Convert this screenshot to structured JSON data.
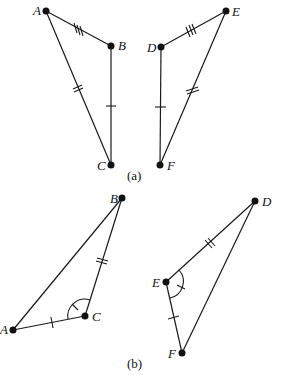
{
  "figure_a": {
    "caption": "(a)",
    "triangle_1": {
      "points": {
        "A": [
          46,
          11
        ],
        "B": [
          111,
          46
        ],
        "C": [
          111,
          165
        ]
      },
      "labels": {
        "A": "A",
        "B": "B",
        "C": "C"
      },
      "marks": {
        "AB": 3,
        "AC": 2,
        "BC": 1
      }
    },
    "triangle_2": {
      "points": {
        "D": [
          161,
          47
        ],
        "E": [
          226,
          11
        ],
        "F": [
          160,
          165
        ]
      },
      "labels": {
        "D": "D",
        "E": "E",
        "F": "F"
      },
      "marks": {
        "DE": 3,
        "EF": 2,
        "DF": 1
      }
    }
  },
  "figure_b": {
    "caption": "(b)",
    "triangle_1": {
      "points": {
        "A": [
          13,
          330
        ],
        "B": [
          122,
          198
        ],
        "C": [
          85,
          316
        ]
      },
      "labels": {
        "A": "A",
        "B": "B",
        "C": "C"
      },
      "marks": {
        "BC": 2,
        "AC": 1
      },
      "angle_mark": "C"
    },
    "triangle_2": {
      "points": {
        "D": [
          255,
          201
        ],
        "E": [
          166,
          282
        ],
        "F": [
          182,
          353
        ]
      },
      "labels": {
        "D": "D",
        "E": "E",
        "F": "F"
      },
      "marks": {
        "DE": 2,
        "EF": 1
      },
      "angle_mark": "E"
    }
  }
}
